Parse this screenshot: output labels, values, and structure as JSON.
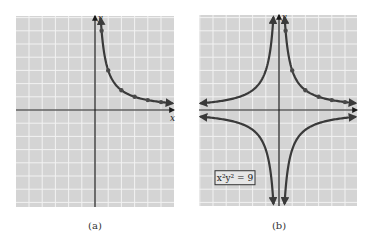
{
  "figure": {
    "panels": [
      {
        "id": "a",
        "label": "(a)",
        "x_axis_label": "x",
        "y_axis_label": "y",
        "grid_box": {
          "left": 16,
          "top": 16,
          "right": 174,
          "bottom": 207
        },
        "origin_px": {
          "x": 95,
          "y": 110
        },
        "cell_px": 13.2,
        "curve": "first-quadrant branch",
        "points": [
          [
            0.5,
            6
          ],
          [
            1,
            3
          ],
          [
            2,
            1.5
          ],
          [
            3,
            1
          ],
          [
            4,
            0.75
          ],
          [
            5,
            0.6
          ]
        ]
      },
      {
        "id": "b",
        "label": "(b)",
        "x_axis_label": "",
        "y_axis_label": "y",
        "equation_box": "x²y² = 9",
        "grid_box": {
          "left": 199,
          "top": 15,
          "right": 357,
          "bottom": 206
        },
        "origin_px": {
          "x": 279,
          "y": 110
        },
        "cell_px": 13.2,
        "curve": "four branches (all quadrants)",
        "points": [
          [
            0.5,
            6
          ],
          [
            1,
            3
          ],
          [
            2,
            1.5
          ],
          [
            3,
            1
          ],
          [
            4,
            0.75
          ],
          [
            5,
            0.6
          ]
        ]
      }
    ],
    "colors": {
      "grid_bg": "#d4d4d4",
      "grid_line": "#f2f2f2",
      "axis": "#1a1a1a",
      "curve": "#3a3a3a",
      "point": "#4a4a4a"
    }
  },
  "chart_data": [
    {
      "type": "line",
      "title": "(a)",
      "xlabel": "x",
      "ylabel": "y",
      "grid": true,
      "xlim": [
        -6,
        6
      ],
      "ylim": [
        -7,
        7
      ],
      "series": [
        {
          "name": "y = 3/x (x > 0)",
          "x": [
            0.5,
            1,
            2,
            3,
            4,
            5
          ],
          "y": [
            6,
            3,
            1.5,
            1,
            0.75,
            0.6
          ]
        }
      ]
    },
    {
      "type": "line",
      "title": "(b)",
      "xlabel": "",
      "ylabel": "y",
      "annotation": "x²y² = 9",
      "grid": true,
      "xlim": [
        -6,
        6
      ],
      "ylim": [
        -7,
        7
      ],
      "series": [
        {
          "name": "xy = 3 (Q1)",
          "x": [
            0.5,
            1,
            2,
            3,
            4,
            5
          ],
          "y": [
            6,
            3,
            1.5,
            1,
            0.75,
            0.6
          ]
        },
        {
          "name": "xy = -3 (Q2)",
          "x": [
            -0.5,
            -1,
            -2,
            -3,
            -4,
            -5
          ],
          "y": [
            6,
            3,
            1.5,
            1,
            0.75,
            0.6
          ]
        },
        {
          "name": "xy = 3 (Q3)",
          "x": [
            -0.5,
            -1,
            -2,
            -3,
            -4,
            -5
          ],
          "y": [
            -6,
            -3,
            -1.5,
            -1,
            -0.75,
            -0.6
          ]
        },
        {
          "name": "xy = -3 (Q4)",
          "x": [
            0.5,
            1,
            2,
            3,
            4,
            5
          ],
          "y": [
            -6,
            -3,
            -1.5,
            -1,
            -0.75,
            -0.6
          ]
        }
      ]
    }
  ]
}
